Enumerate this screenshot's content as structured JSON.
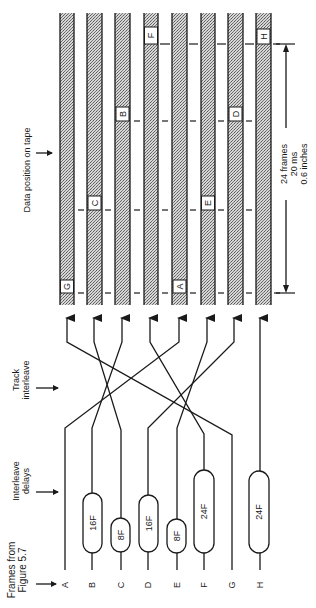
{
  "figure": {
    "orientation": "rotated-90-ccw",
    "annotations": {
      "data_position": "Data position on tape",
      "track_interleave_line1": "Track",
      "track_interleave_line2": "interleave",
      "interleave_delays_line1": "Interleave",
      "interleave_delays_line2": "delays",
      "frames_from_line1": "Frames from",
      "frames_from_line2": "Figure 5.7"
    },
    "dimension": {
      "line1": "24 frames",
      "line2": "20 ms",
      "line3": "0.6 inches"
    },
    "inputs": [
      {
        "label": "A",
        "delay": ""
      },
      {
        "label": "B",
        "delay": "16F"
      },
      {
        "label": "C",
        "delay": "8F"
      },
      {
        "label": "D",
        "delay": "16F"
      },
      {
        "label": "E",
        "delay": "8F"
      },
      {
        "label": "F",
        "delay": "24F"
      },
      {
        "label": "G",
        "delay": ""
      },
      {
        "label": "H",
        "delay": "24F"
      }
    ],
    "tracks": [
      {
        "index": 1,
        "frame": "G",
        "position_row": 4
      },
      {
        "index": 2,
        "frame": "C",
        "position_row": 3
      },
      {
        "index": 3,
        "frame": "B",
        "position_row": 2
      },
      {
        "index": 4,
        "frame": "F",
        "position_row": 1
      },
      {
        "index": 5,
        "frame": "A",
        "position_row": 4
      },
      {
        "index": 6,
        "frame": "E",
        "position_row": 3
      },
      {
        "index": 7,
        "frame": "D",
        "position_row": 2
      },
      {
        "index": 8,
        "frame": "H",
        "position_row": 1
      }
    ],
    "routing": [
      {
        "from": "A",
        "to_track": 5
      },
      {
        "from": "B",
        "to_track": 3
      },
      {
        "from": "C",
        "to_track": 2
      },
      {
        "from": "D",
        "to_track": 7
      },
      {
        "from": "E",
        "to_track": 6
      },
      {
        "from": "F",
        "to_track": 4
      },
      {
        "from": "G",
        "to_track": 1
      },
      {
        "from": "H",
        "to_track": 8
      }
    ],
    "colors": {
      "ink": "#1a1a1a",
      "stipple": "#9a9a9a",
      "background": "#ffffff"
    }
  }
}
